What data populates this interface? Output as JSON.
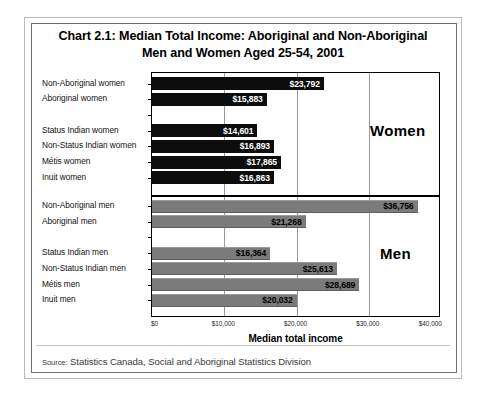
{
  "title": {
    "line1": "Chart 2.1:  Median Total Income:  Aboriginal and Non-Aboriginal",
    "line2": "Men and Women Aged 25-54, 2001"
  },
  "source": {
    "label": "Source:",
    "text": "Statistics Canada, Social and Aboriginal Statistics Division"
  },
  "annotations": {
    "women": "Women",
    "men": "Men"
  },
  "chart_data": {
    "type": "bar",
    "orientation": "horizontal",
    "title": "Chart 2.1:  Median Total Income:  Aboriginal and Non-Aboriginal Men and Women Aged 25-54, 2001",
    "xlabel": "Median total income",
    "ylabel": "",
    "xlim": [
      0,
      40000
    ],
    "xticks": [
      0,
      10000,
      20000,
      30000,
      40000
    ],
    "xticklabels": [
      "$0",
      "$10,000",
      "$20,000",
      "$30,000",
      "$40,000"
    ],
    "grid": true,
    "legend": false,
    "groups": [
      {
        "name": "Women",
        "color": "#0d0d0d",
        "categories": [
          "Non-Aboriginal women",
          "Aboriginal women",
          "",
          "Status Indian women",
          "Non-Status Indian women",
          "Métis women",
          "Inuit women"
        ],
        "values": [
          23792,
          15883,
          null,
          14601,
          16893,
          17865,
          16863
        ],
        "labels": [
          "$23,792",
          "$15,883",
          "",
          "$14,601",
          "$16,893",
          "$17,865",
          "$16,863"
        ]
      },
      {
        "name": "Men",
        "color": "#7b7b7b",
        "categories": [
          "Non-Aboriginal men",
          "Aboriginal men",
          "",
          "Status Indian men",
          "Non-Status Indian men",
          "Métis men",
          "Inuit men"
        ],
        "values": [
          36756,
          21268,
          null,
          16364,
          25613,
          28689,
          20032
        ],
        "labels": [
          "$36,756",
          "$21,268",
          "",
          "$16,364",
          "$25,613",
          "$28,689",
          "$20,032"
        ]
      }
    ]
  }
}
